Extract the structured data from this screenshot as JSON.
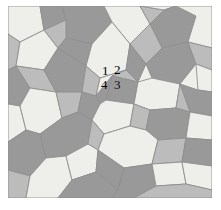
{
  "figure": {
    "width": 221,
    "height": 210,
    "background_color": "#ffffff",
    "margin_px": 8,
    "palette": {
      "page_background": "#ffffff",
      "light_tile": "#eeeeea",
      "light_tile_alt": "#e9e9e4",
      "medium_tile": "#bcbcbc",
      "dark_tile": "#999999",
      "dark_tile_alt": "#949494",
      "edge_line": "#8e8e8e",
      "label_color": "#000000"
    },
    "tile_tones": [
      {
        "name": "light-heptagon",
        "color": "#eeeeea",
        "role": "large light polygon"
      },
      {
        "name": "medium-triangle",
        "color": "#bcbcbc",
        "role": "small mid-gray triangle"
      },
      {
        "name": "dark-quad",
        "color": "#999999",
        "role": "dark gray square / pentagon"
      }
    ]
  },
  "labels": {
    "items": [
      {
        "id": "1",
        "text": "1",
        "position": "upper-left of vertex"
      },
      {
        "id": "2",
        "text": "2",
        "position": "upper-right of vertex"
      },
      {
        "id": "3",
        "text": "3",
        "position": "lower-right of vertex"
      },
      {
        "id": "4",
        "text": "4",
        "position": "lower-left of vertex"
      }
    ],
    "label_1": "1",
    "label_2": "2",
    "label_3": "3",
    "label_4": "4",
    "vertex_x": 112,
    "vertex_y": 76
  }
}
